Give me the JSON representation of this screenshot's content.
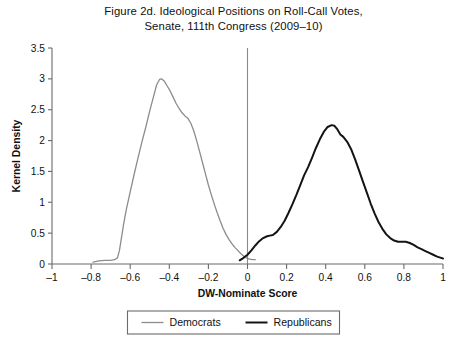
{
  "figure": {
    "title_lines": [
      "Figure 2d.  Ideological Positions on Roll-Call Votes,",
      "Senate, 111th Congress (2009–10)"
    ]
  },
  "chart_data": {
    "type": "line",
    "title": "Figure 2d.  Ideological Positions on Roll-Call Votes, Senate, 111th Congress (2009–10)",
    "xlabel": "DW-Nominate Score",
    "ylabel": "Kernel Density",
    "xlim": [
      -1,
      1
    ],
    "ylim": [
      0,
      3.5
    ],
    "xticks": [
      -1,
      -0.8,
      -0.6,
      -0.4,
      -0.2,
      0,
      0.2,
      0.4,
      0.6,
      0.8,
      1
    ],
    "xticklabels": [
      "–1",
      "–0.8",
      "–0.6",
      "–0.4",
      "–0.2",
      "0",
      "0.2",
      "0.4",
      "0.6",
      "0.8",
      "1"
    ],
    "yticks": [
      0,
      0.5,
      1,
      1.5,
      2,
      2.5,
      3,
      3.5
    ],
    "yticklabels": [
      "0",
      "0.5",
      "1",
      "1.5",
      "2",
      "2.5",
      "3",
      "3.5"
    ],
    "grid": false,
    "legend_position": "bottom-center",
    "annotations": [
      {
        "name": "zero-reference-line",
        "type": "vline",
        "x": 0
      }
    ],
    "series": [
      {
        "name": "Democrats",
        "color": "#8c8c8c",
        "width": 1.3,
        "points": [
          [
            -0.79,
            0.03
          ],
          [
            -0.76,
            0.05
          ],
          [
            -0.73,
            0.06
          ],
          [
            -0.7,
            0.06
          ],
          [
            -0.68,
            0.07
          ],
          [
            -0.665,
            0.1
          ],
          [
            -0.655,
            0.22
          ],
          [
            -0.645,
            0.42
          ],
          [
            -0.635,
            0.62
          ],
          [
            -0.62,
            0.88
          ],
          [
            -0.6,
            1.17
          ],
          [
            -0.58,
            1.45
          ],
          [
            -0.56,
            1.72
          ],
          [
            -0.54,
            1.98
          ],
          [
            -0.52,
            2.22
          ],
          [
            -0.5,
            2.48
          ],
          [
            -0.48,
            2.72
          ],
          [
            -0.465,
            2.9
          ],
          [
            -0.45,
            2.99
          ],
          [
            -0.44,
            3.0
          ],
          [
            -0.425,
            2.96
          ],
          [
            -0.41,
            2.88
          ],
          [
            -0.395,
            2.8
          ],
          [
            -0.38,
            2.7
          ],
          [
            -0.365,
            2.6
          ],
          [
            -0.35,
            2.52
          ],
          [
            -0.335,
            2.45
          ],
          [
            -0.32,
            2.4
          ],
          [
            -0.305,
            2.36
          ],
          [
            -0.29,
            2.28
          ],
          [
            -0.275,
            2.16
          ],
          [
            -0.26,
            2.0
          ],
          [
            -0.245,
            1.82
          ],
          [
            -0.23,
            1.64
          ],
          [
            -0.215,
            1.46
          ],
          [
            -0.2,
            1.28
          ],
          [
            -0.185,
            1.12
          ],
          [
            -0.17,
            0.97
          ],
          [
            -0.155,
            0.83
          ],
          [
            -0.14,
            0.7
          ],
          [
            -0.125,
            0.58
          ],
          [
            -0.11,
            0.48
          ],
          [
            -0.095,
            0.4
          ],
          [
            -0.08,
            0.33
          ],
          [
            -0.065,
            0.27
          ],
          [
            -0.05,
            0.22
          ],
          [
            -0.035,
            0.17
          ],
          [
            -0.02,
            0.13
          ],
          [
            -0.005,
            0.1
          ],
          [
            0.01,
            0.08
          ],
          [
            0.025,
            0.07
          ],
          [
            0.04,
            0.07
          ]
        ]
      },
      {
        "name": "Republicans",
        "color": "#141414",
        "width": 2.0,
        "points": [
          [
            -0.04,
            0.06
          ],
          [
            -0.02,
            0.1
          ],
          [
            0.0,
            0.15
          ],
          [
            0.02,
            0.22
          ],
          [
            0.04,
            0.3
          ],
          [
            0.06,
            0.37
          ],
          [
            0.08,
            0.42
          ],
          [
            0.1,
            0.45
          ],
          [
            0.115,
            0.46
          ],
          [
            0.13,
            0.47
          ],
          [
            0.15,
            0.52
          ],
          [
            0.17,
            0.6
          ],
          [
            0.19,
            0.7
          ],
          [
            0.21,
            0.83
          ],
          [
            0.23,
            0.97
          ],
          [
            0.25,
            1.12
          ],
          [
            0.27,
            1.28
          ],
          [
            0.29,
            1.44
          ],
          [
            0.31,
            1.57
          ],
          [
            0.33,
            1.72
          ],
          [
            0.35,
            1.88
          ],
          [
            0.37,
            2.02
          ],
          [
            0.39,
            2.14
          ],
          [
            0.41,
            2.22
          ],
          [
            0.43,
            2.25
          ],
          [
            0.445,
            2.24
          ],
          [
            0.46,
            2.18
          ],
          [
            0.475,
            2.1
          ],
          [
            0.49,
            2.06
          ],
          [
            0.51,
            1.98
          ],
          [
            0.53,
            1.86
          ],
          [
            0.55,
            1.7
          ],
          [
            0.57,
            1.52
          ],
          [
            0.59,
            1.34
          ],
          [
            0.61,
            1.16
          ],
          [
            0.63,
            0.98
          ],
          [
            0.65,
            0.82
          ],
          [
            0.67,
            0.68
          ],
          [
            0.69,
            0.57
          ],
          [
            0.71,
            0.48
          ],
          [
            0.73,
            0.42
          ],
          [
            0.75,
            0.38
          ],
          [
            0.77,
            0.36
          ],
          [
            0.79,
            0.36
          ],
          [
            0.81,
            0.36
          ],
          [
            0.83,
            0.34
          ],
          [
            0.85,
            0.31
          ],
          [
            0.87,
            0.27
          ],
          [
            0.89,
            0.24
          ],
          [
            0.91,
            0.21
          ],
          [
            0.93,
            0.18
          ],
          [
            0.95,
            0.15
          ],
          [
            0.97,
            0.12
          ],
          [
            0.99,
            0.1
          ],
          [
            1.0,
            0.09
          ]
        ]
      }
    ]
  },
  "legend": {
    "items": [
      {
        "label": "Democrats",
        "color": "#8c8c8c",
        "width": 1.3
      },
      {
        "label": "Republicans",
        "color": "#141414",
        "width": 2.0
      }
    ]
  }
}
